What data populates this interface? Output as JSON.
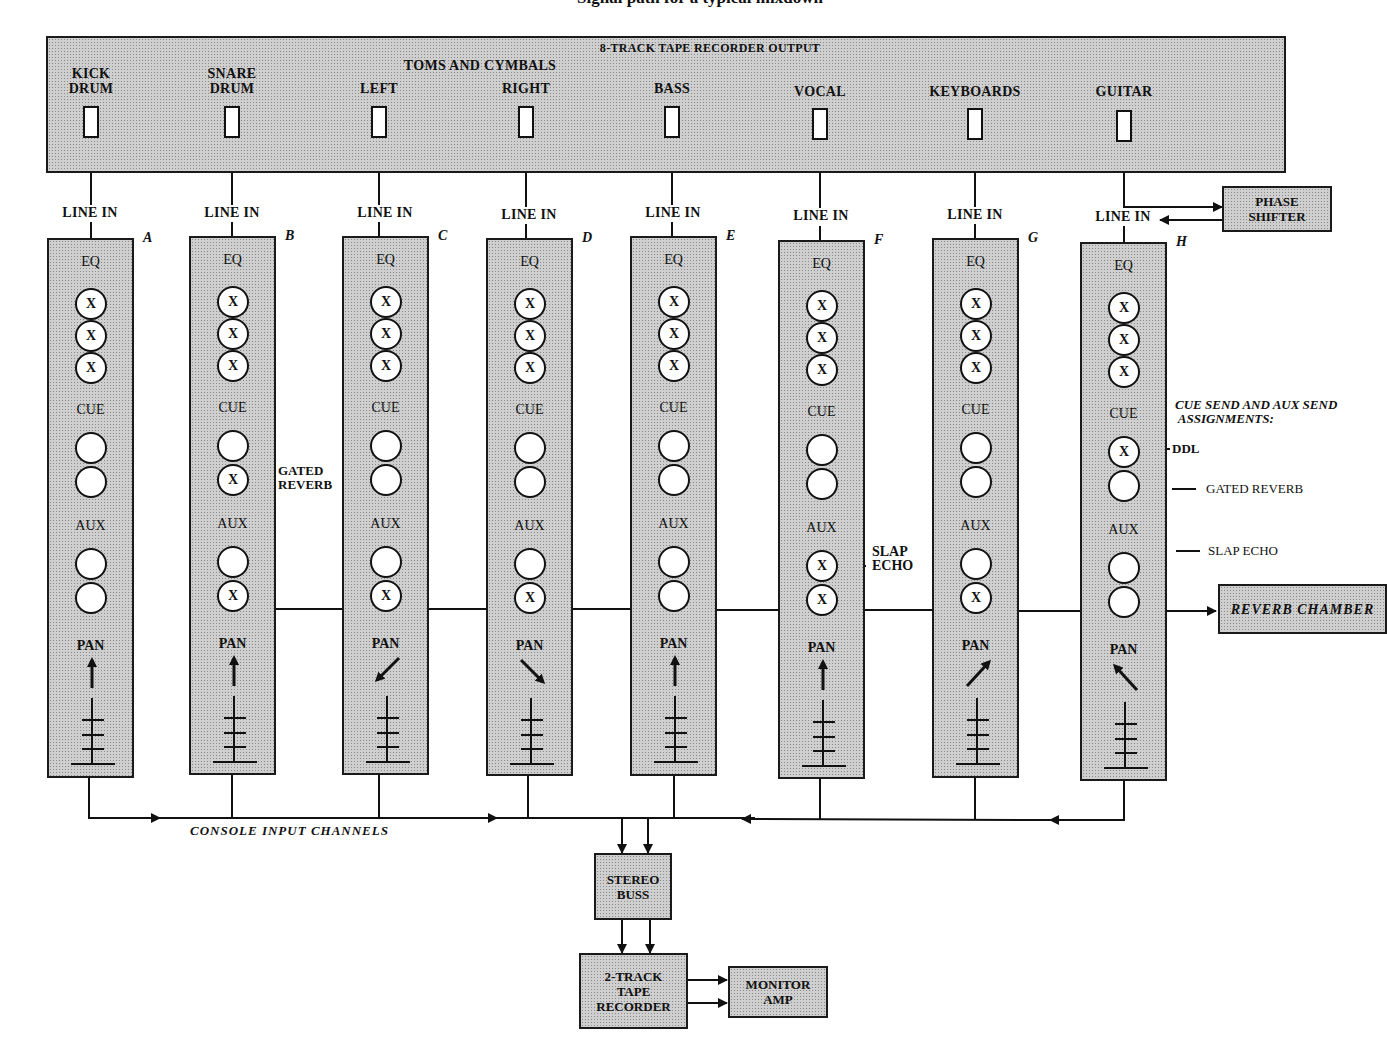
{
  "title": "Signal path for a typical mixdown",
  "tape_output": {
    "title": "8-TRACK TAPE RECORDER OUTPUT",
    "group_label": "TOMS AND CYMBALS",
    "tracks": [
      {
        "name": "KICK\nDRUM"
      },
      {
        "name": "SNARE\nDRUM"
      },
      {
        "name": "LEFT"
      },
      {
        "name": "RIGHT"
      },
      {
        "name": "BASS"
      },
      {
        "name": "VOCAL"
      },
      {
        "name": "KEYBOARDS"
      },
      {
        "name": "GUITAR"
      }
    ]
  },
  "line_in_label": "LINE IN",
  "section_labels": {
    "eq": "EQ",
    "cue": "CUE",
    "aux": "AUX",
    "pan": "PAN"
  },
  "knob_mark": "X",
  "channels": [
    {
      "letter": "A",
      "eq": [
        "X",
        "X",
        "X"
      ],
      "cue": [
        "",
        ""
      ],
      "aux": [
        "",
        ""
      ],
      "pan": "center"
    },
    {
      "letter": "B",
      "eq": [
        "X",
        "X",
        "X"
      ],
      "cue": [
        "",
        "X"
      ],
      "aux": [
        "",
        "X"
      ],
      "pan": "center"
    },
    {
      "letter": "C",
      "eq": [
        "X",
        "X",
        "X"
      ],
      "cue": [
        "",
        ""
      ],
      "aux": [
        "",
        "X"
      ],
      "pan": "left"
    },
    {
      "letter": "D",
      "eq": [
        "X",
        "X",
        "X"
      ],
      "cue": [
        "",
        ""
      ],
      "aux": [
        "",
        "X"
      ],
      "pan": "right"
    },
    {
      "letter": "E",
      "eq": [
        "X",
        "X",
        "X"
      ],
      "cue": [
        "",
        ""
      ],
      "aux": [
        "",
        ""
      ],
      "pan": "center"
    },
    {
      "letter": "F",
      "eq": [
        "X",
        "X",
        "X"
      ],
      "cue": [
        "",
        ""
      ],
      "aux": [
        "X",
        "X"
      ],
      "pan": "center"
    },
    {
      "letter": "G",
      "eq": [
        "X",
        "X",
        "X"
      ],
      "cue": [
        "",
        ""
      ],
      "aux": [
        "",
        "X"
      ],
      "pan": "right-up"
    },
    {
      "letter": "H",
      "eq": [
        "X",
        "X",
        "X"
      ],
      "cue": [
        "X",
        ""
      ],
      "aux": [
        "",
        ""
      ],
      "pan": "left-up"
    }
  ],
  "annotations": {
    "gated_reverb_b": "GATED\nREVERB",
    "slap_echo_f": "SLAP\nECHO",
    "assignments_title": "CUE SEND AND AUX SEND\n ASSIGNMENTS:",
    "assignments": [
      "DDL",
      "GATED REVERB",
      "SLAP ECHO"
    ]
  },
  "boxes": {
    "phase_shifter": "PHASE\nSHIFTER",
    "reverb_chamber": "REVERB  CHAMBER",
    "stereo_buss": "STEREO\nBUSS",
    "two_track": "2-TRACK\nTAPE\nRECORDER",
    "monitor_amp": "MONITOR\nAMP"
  },
  "console_label": "CONSOLE  INPUT  CHANNELS",
  "colors": {
    "fill": "#cfcfcf",
    "line": "#1a1a1a",
    "knob": "#ffffff"
  }
}
